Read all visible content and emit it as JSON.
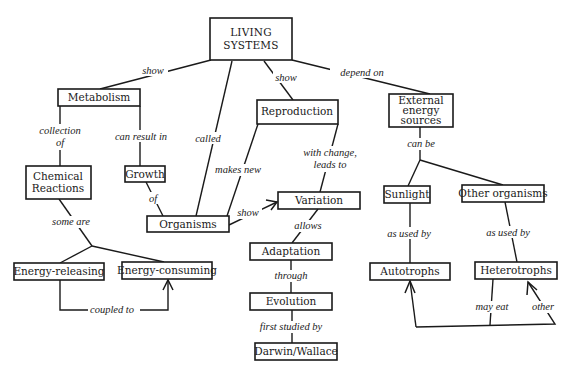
{
  "diagram": {
    "type": "concept-map",
    "nodes": {
      "living_systems": {
        "line1": "LIVING",
        "line2": "SYSTEMS"
      },
      "metabolism": {
        "label": "Metabolism"
      },
      "reproduction": {
        "label": "Reproduction"
      },
      "external_energy": {
        "line1": "External",
        "line2": "energy",
        "line3": "sources"
      },
      "chemical_reactions": {
        "line1": "Chemical",
        "line2": "Reactions"
      },
      "growth": {
        "label": "Growth"
      },
      "organisms": {
        "label": "Organisms"
      },
      "variation": {
        "label": "Variation"
      },
      "sunlight": {
        "label": "Sunlight"
      },
      "other_organisms": {
        "label": "Other organisms"
      },
      "adaptation": {
        "label": "Adaptation"
      },
      "energy_releasing": {
        "label": "Energy-releasing"
      },
      "energy_consuming": {
        "label": "Energy-consuming"
      },
      "autotrophs": {
        "label": "Autotrophs"
      },
      "heterotrophs": {
        "label": "Heterotrophs"
      },
      "evolution": {
        "label": "Evolution"
      },
      "darwin_wallace": {
        "label": "Darwin/Wallace"
      }
    },
    "links": {
      "show_metabolism": "show",
      "called": "called",
      "show_reproduction": "show",
      "depend_on": "depend on",
      "collection_of_1": "collection",
      "collection_of_2": "of",
      "can_result_in": "can result in",
      "of": "of",
      "makes_new": "makes new",
      "with_change_1": "with change,",
      "with_change_2": "leads to",
      "can_be": "can be",
      "some_are": "some are",
      "show_variation": "show",
      "allows": "allows",
      "as_used_by_1": "as used by",
      "as_used_by_2": "as used by",
      "through": "through",
      "coupled_to": "coupled to",
      "first_studied_by": "first studied by",
      "may_eat": "may eat",
      "other": "other"
    },
    "edges": [
      {
        "from": "LIVING SYSTEMS",
        "to": "Metabolism",
        "label": "show"
      },
      {
        "from": "LIVING SYSTEMS",
        "to": "Organisms",
        "label": "called"
      },
      {
        "from": "LIVING SYSTEMS",
        "to": "Reproduction",
        "label": "show"
      },
      {
        "from": "LIVING SYSTEMS",
        "to": "External energy sources",
        "label": "depend on"
      },
      {
        "from": "Metabolism",
        "to": "Chemical Reactions",
        "label": "collection of"
      },
      {
        "from": "Metabolism",
        "to": "Growth",
        "label": "can result in"
      },
      {
        "from": "Growth",
        "to": "Organisms",
        "label": "of"
      },
      {
        "from": "Reproduction",
        "to": "Organisms",
        "label": "makes new"
      },
      {
        "from": "Reproduction",
        "to": "Variation",
        "label": "with change, leads to"
      },
      {
        "from": "Organisms",
        "to": "Variation",
        "label": "show"
      },
      {
        "from": "Variation",
        "to": "Adaptation",
        "label": "allows"
      },
      {
        "from": "Adaptation",
        "to": "Evolution",
        "label": "through"
      },
      {
        "from": "Evolution",
        "to": "Darwin/Wallace",
        "label": "first studied by"
      },
      {
        "from": "Chemical Reactions",
        "to": "Energy-releasing",
        "label": "some are"
      },
      {
        "from": "Chemical Reactions",
        "to": "Energy-consuming",
        "label": "some are"
      },
      {
        "from": "Energy-releasing",
        "to": "Energy-consuming",
        "label": "coupled to"
      },
      {
        "from": "External energy sources",
        "to": "Sunlight",
        "label": "can be"
      },
      {
        "from": "External energy sources",
        "to": "Other organisms",
        "label": "can be"
      },
      {
        "from": "Sunlight",
        "to": "Autotrophs",
        "label": "as used by"
      },
      {
        "from": "Other organisms",
        "to": "Heterotrophs",
        "label": "as used by"
      },
      {
        "from": "Heterotrophs",
        "to": "Autotrophs",
        "label": "may eat"
      },
      {
        "from": "Heterotrophs",
        "to": "Heterotrophs",
        "label": "other"
      }
    ],
    "colors": {
      "stroke": "#1a1a1a",
      "background": "#ffffff",
      "text": "#1a1a1a"
    }
  }
}
